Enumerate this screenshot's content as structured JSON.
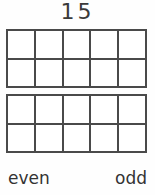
{
  "worksheet": {
    "number_label": "15",
    "frames": [
      {
        "name": "ten-frame-1",
        "rows": 2,
        "columns": 5,
        "filled_count": 0,
        "cells": [
          false,
          false,
          false,
          false,
          false,
          false,
          false,
          false,
          false,
          false
        ]
      },
      {
        "name": "ten-frame-2",
        "rows": 2,
        "columns": 5,
        "filled_count": 0,
        "cells": [
          false,
          false,
          false,
          false,
          false,
          false,
          false,
          false,
          false,
          false
        ]
      }
    ],
    "answers": {
      "even_label": "even",
      "odd_label": "odd"
    },
    "colors": {
      "line": "#4a4a4a",
      "text": "#333333",
      "background": "#fefefe"
    }
  }
}
